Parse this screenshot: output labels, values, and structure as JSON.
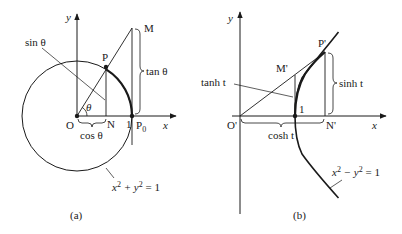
{
  "figure": {
    "panel_a": {
      "caption": "(a)",
      "axis_x": "x",
      "axis_y": "y",
      "points": {
        "origin": "O",
        "P": "P",
        "N": "N",
        "M": "M",
        "P0": "P",
        "P0_sub": "0",
        "one": "1"
      },
      "angle": "θ",
      "labels": {
        "sin": "sin θ",
        "cos": "cos θ",
        "tan": "tan θ"
      },
      "equation": {
        "a": "x",
        "b": "2",
        "c": " + y",
        "d": "2",
        "e": " = 1"
      }
    },
    "panel_b": {
      "caption": "(b)",
      "axis_x": "x",
      "axis_y": "y",
      "points": {
        "origin": "O'",
        "P": "P'",
        "N": "N'",
        "M": "M'",
        "one": "1"
      },
      "labels": {
        "tanh": "tanh t",
        "cosh": "cosh t",
        "sinh": "sinh t"
      },
      "equation": {
        "a": "x",
        "b": "2",
        "c": " − y",
        "d": "2",
        "e": " = 1"
      }
    },
    "colors": {
      "ink": "#1a1a1a",
      "background": "#ffffff"
    }
  }
}
